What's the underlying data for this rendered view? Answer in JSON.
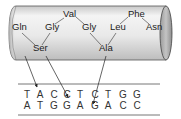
{
  "cylinder": {
    "fill_color": "#e6e6e6",
    "cap_color": "#b8b8b8",
    "stroke_color": "#444444"
  },
  "amino_acids": [
    {
      "label": "Gln",
      "x": 12,
      "y": 30
    },
    {
      "label": "Gly",
      "x": 45,
      "y": 30
    },
    {
      "label": "Val",
      "x": 63,
      "y": 17
    },
    {
      "label": "Gly",
      "x": 82,
      "y": 30
    },
    {
      "label": "Leu",
      "x": 110,
      "y": 30
    },
    {
      "label": "Phe",
      "x": 128,
      "y": 17
    },
    {
      "label": "Asn",
      "x": 146,
      "y": 30
    },
    {
      "label": "Ser",
      "x": 33,
      "y": 51
    },
    {
      "label": "Ala",
      "x": 99,
      "y": 51
    }
  ],
  "dna": {
    "top_strand": [
      "T",
      "A",
      "C",
      "C",
      "T",
      "C",
      "T",
      "G",
      "G"
    ],
    "bottom_strand": [
      "A",
      "T",
      "G",
      "G",
      "A",
      "G",
      "A",
      "C",
      "C"
    ]
  }
}
